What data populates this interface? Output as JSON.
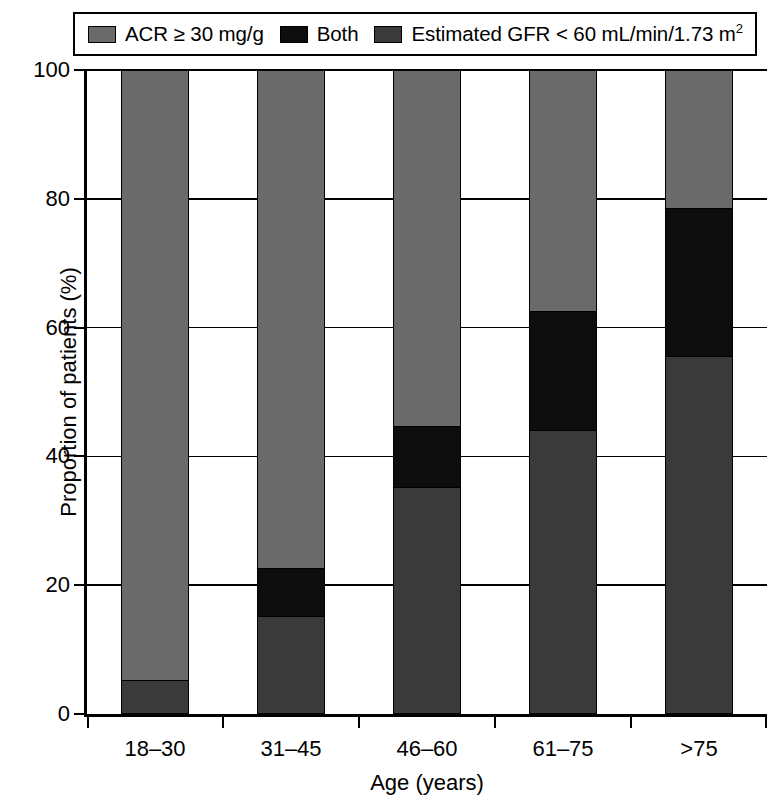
{
  "chart_data": {
    "type": "bar",
    "subtype": "stacked-bar-100",
    "title": "",
    "xlabel": "Age (years)",
    "ylabel": "Proportion of patients (%)",
    "categories": [
      "18–30",
      "31–45",
      "46–60",
      "61–75",
      ">75"
    ],
    "ylim": [
      0,
      100
    ],
    "yticks": [
      0,
      20,
      40,
      60,
      80,
      100
    ],
    "ytick_labels": [
      "0",
      "20",
      "40",
      "60",
      "80",
      "100"
    ],
    "grid": true,
    "legend_position": "top",
    "series": [
      {
        "name": "Estimated GFR < 60 mL/min/1.73 m²",
        "key": "gfr",
        "color": "#3a3a3a",
        "stack_order": 1,
        "values": [
          5,
          15,
          35,
          44,
          55.5
        ]
      },
      {
        "name": "Both",
        "key": "both",
        "color": "#0d0d0d",
        "stack_order": 2,
        "values": [
          0,
          7.5,
          9.5,
          18.5,
          23
        ]
      },
      {
        "name": "ACR ≥ 30 mg/g",
        "key": "acr",
        "color": "#6a6a6a",
        "stack_order": 3,
        "values": [
          95,
          77.5,
          55.5,
          37.5,
          21.5
        ]
      }
    ]
  },
  "legend": {
    "items": [
      {
        "label": "ACR ≥ 30 mg/g",
        "color": "#6a6a6a",
        "sup": ""
      },
      {
        "label": "Both",
        "color": "#0d0d0d",
        "sup": ""
      },
      {
        "label": "Estimated GFR < 60 mL/min/1.73 m",
        "color": "#3a3a3a",
        "sup": "2"
      }
    ]
  },
  "axes": {
    "y_title": "Proportion of patients (%)",
    "x_title": "Age (years)",
    "y_tick_labels": [
      "0",
      "20",
      "40",
      "60",
      "80",
      "100"
    ],
    "x_tick_labels": [
      "18–30",
      "31–45",
      "46–60",
      "61–75",
      ">75"
    ]
  }
}
